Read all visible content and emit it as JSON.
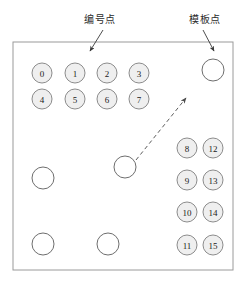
{
  "figure": {
    "width": 248,
    "height": 284,
    "background": "#ffffff",
    "frame": {
      "name": "workspace-frame",
      "x": 13,
      "y": 42,
      "width": 220,
      "height": 228,
      "stroke": "#9a9a9a",
      "fill": "#ffffff"
    }
  },
  "annotations": [
    {
      "id": "numbered-points",
      "text": "编号点",
      "label_x": 100,
      "label_y": 20,
      "leader": {
        "x1": 103,
        "y1": 30,
        "x2": 90,
        "y2": 51
      }
    },
    {
      "id": "template-points",
      "text": "模板点",
      "label_x": 205,
      "label_y": 20,
      "leader": {
        "x1": 203,
        "y1": 30,
        "x2": 214,
        "y2": 51
      }
    }
  ],
  "numbered_points": {
    "radius": 10,
    "fill": "#efefef",
    "stroke": "#8c8c8c",
    "text_color": "#1a1a1a",
    "items": [
      {
        "label": "0",
        "cx": 42,
        "cy": 73
      },
      {
        "label": "1",
        "cx": 75,
        "cy": 73
      },
      {
        "label": "2",
        "cx": 107,
        "cy": 73
      },
      {
        "label": "3",
        "cx": 139,
        "cy": 73
      },
      {
        "label": "4",
        "cx": 42,
        "cy": 99
      },
      {
        "label": "5",
        "cx": 75,
        "cy": 99
      },
      {
        "label": "6",
        "cx": 107,
        "cy": 99
      },
      {
        "label": "7",
        "cx": 139,
        "cy": 99
      },
      {
        "label": "8",
        "cx": 187,
        "cy": 148
      },
      {
        "label": "12",
        "cx": 213,
        "cy": 148
      },
      {
        "label": "9",
        "cx": 187,
        "cy": 180
      },
      {
        "label": "13",
        "cx": 213,
        "cy": 180
      },
      {
        "label": "10",
        "cx": 187,
        "cy": 212
      },
      {
        "label": "14",
        "cx": 213,
        "cy": 212
      },
      {
        "label": "11",
        "cx": 187,
        "cy": 245
      },
      {
        "label": "15",
        "cx": 213,
        "cy": 245
      }
    ]
  },
  "template_points": {
    "radius": 11,
    "fill": "#ffffff",
    "stroke": "#6e6e6e",
    "items": [
      {
        "id": "template-point-top-right",
        "cx": 213,
        "cy": 70
      },
      {
        "id": "template-point-left",
        "cx": 43,
        "cy": 178
      },
      {
        "id": "template-point-center",
        "cx": 125,
        "cy": 167
      },
      {
        "id": "template-point-bottom-left",
        "cx": 43,
        "cy": 244
      },
      {
        "id": "template-point-bottom-center",
        "cx": 108,
        "cy": 244
      }
    ]
  },
  "match_arrow": {
    "name": "match-arrow",
    "x1": 136,
    "y1": 160,
    "x2": 186,
    "y2": 98,
    "stroke": "#4a4a4a",
    "dash": "4 3"
  }
}
